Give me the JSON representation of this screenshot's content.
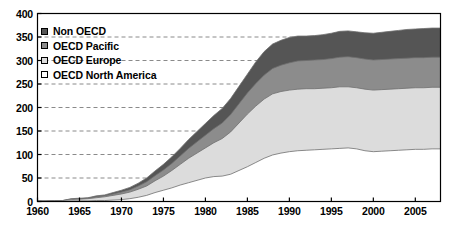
{
  "chart_data": {
    "type": "area",
    "title": "",
    "subtitle": "",
    "xlabel": "",
    "ylabel": "",
    "stacked": true,
    "grid": true,
    "grid_style": "dashed-horizontal",
    "legend_position": "top-left-inside",
    "xlim": [
      1960,
      2008
    ],
    "ylim": [
      0,
      400
    ],
    "xticks": [
      1960,
      1965,
      1970,
      1975,
      1980,
      1985,
      1990,
      1995,
      2000,
      2005
    ],
    "yticks": [
      0,
      50,
      100,
      150,
      200,
      250,
      300,
      350,
      400
    ],
    "xtick_labels": [
      "1960",
      "1965",
      "1970",
      "1975",
      "1980",
      "1985",
      "1990",
      "1995",
      "2000",
      "2005"
    ],
    "ytick_labels": [
      "0",
      "50",
      "100",
      "150",
      "200",
      "250",
      "300",
      "350",
      "400"
    ],
    "x": [
      1960,
      1961,
      1962,
      1963,
      1964,
      1965,
      1966,
      1967,
      1968,
      1969,
      1970,
      1971,
      1972,
      1973,
      1974,
      1975,
      1976,
      1977,
      1978,
      1979,
      1980,
      1981,
      1982,
      1983,
      1984,
      1985,
      1986,
      1987,
      1988,
      1989,
      1990,
      1991,
      1992,
      1993,
      1994,
      1995,
      1996,
      1997,
      1998,
      1999,
      2000,
      2001,
      2002,
      2003,
      2004,
      2005,
      2006,
      2007,
      2008
    ],
    "series": [
      {
        "name": "OECD North America",
        "color": "#ffffff",
        "order": 1,
        "values": [
          0,
          0,
          0,
          0,
          1,
          1,
          1,
          2,
          2,
          3,
          4,
          6,
          9,
          13,
          19,
          24,
          29,
          35,
          40,
          45,
          50,
          53,
          54,
          58,
          66,
          74,
          83,
          92,
          99,
          103,
          106,
          108,
          109,
          110,
          111,
          112,
          113,
          114,
          112,
          108,
          106,
          107,
          108,
          109,
          110,
          111,
          111,
          112,
          112
        ]
      },
      {
        "name": "OECD Europe",
        "color": "#dcdcdc",
        "order": 2,
        "values": [
          1,
          1,
          2,
          2,
          3,
          4,
          5,
          6,
          8,
          10,
          12,
          14,
          17,
          20,
          25,
          30,
          37,
          44,
          52,
          58,
          64,
          72,
          80,
          90,
          101,
          112,
          120,
          126,
          130,
          131,
          131,
          131,
          131,
          130,
          130,
          130,
          131,
          130,
          130,
          131,
          131,
          131,
          131,
          131,
          131,
          131,
          131,
          131,
          131
        ]
      },
      {
        "name": "OECD Pacific",
        "color": "#8c8c8c",
        "order": 3,
        "values": [
          0,
          0,
          0,
          0,
          1,
          1,
          1,
          2,
          2,
          3,
          4,
          5,
          7,
          9,
          11,
          13,
          15,
          18,
          21,
          24,
          27,
          30,
          33,
          37,
          41,
          45,
          48,
          51,
          54,
          56,
          58,
          60,
          60,
          61,
          61,
          62,
          63,
          64,
          64,
          64,
          64,
          64,
          64,
          64,
          64,
          64,
          64,
          64,
          64
        ]
      },
      {
        "name": "Non OECD",
        "color": "#555555",
        "order": 4,
        "values": [
          0,
          0,
          0,
          0,
          1,
          1,
          1,
          2,
          2,
          3,
          4,
          5,
          6,
          8,
          10,
          12,
          14,
          16,
          19,
          22,
          25,
          28,
          31,
          34,
          37,
          40,
          46,
          50,
          52,
          53,
          54,
          53,
          52,
          52,
          53,
          54,
          55,
          55,
          55,
          56,
          57,
          58,
          59,
          60,
          61,
          61,
          62,
          62,
          62
        ]
      }
    ],
    "cumulative_totals_right_edge": {
      "north_america": 112,
      "europe_top": 243,
      "pacific_top": 307,
      "total": 369
    },
    "annotations": []
  },
  "legend": {
    "items": [
      {
        "label": "Non OECD",
        "swatch": "#555555"
      },
      {
        "label": "OECD Pacific",
        "swatch": "#8c8c8c"
      },
      {
        "label": "OECD Europe",
        "swatch": "#dcdcdc"
      },
      {
        "label": "OECD North America",
        "swatch": "#ffffff"
      }
    ]
  },
  "style": {
    "axis_color": "#000000",
    "grid_color": "#8a8a8a",
    "plot_background": "#ffffff",
    "series_outline": "#6e6e6e"
  }
}
